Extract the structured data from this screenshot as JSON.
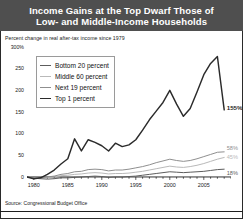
{
  "title": {
    "line1": "Income Gains at the Top Dwarf Those of",
    "line2": "Low- and Middle-Income Households"
  },
  "subtitle": "Percent change in real after-tax income since 1979",
  "source": "Source: Congressional Budget Office",
  "colors": {
    "title_bar": "#4f4f4f",
    "title_text": "#ffffff",
    "top1": "#2b2b2b",
    "next19": "#8f8f8f",
    "middle60": "#b9b9b9",
    "bottom20": "#5d5d5d",
    "axis": "#1a1a1a",
    "frame": "#2a2a2a"
  },
  "chart_data": {
    "type": "line",
    "title": "Income Gains at the Top Dwarf Those of Low- and Middle-Income Households",
    "subtitle": "Percent change in real after-tax income since 1979",
    "xlabel": "",
    "ylabel": "Percent change in real after-tax income since 1979",
    "xlim": [
      1979,
      2009
    ],
    "ylim": [
      0,
      300
    ],
    "grid": false,
    "legend_position": "upper-left-inside",
    "ytick_labels": [
      "300%",
      "250",
      "200",
      "150",
      "100",
      "50",
      "0"
    ],
    "ytick_values": [
      300,
      250,
      200,
      150,
      100,
      50,
      0
    ],
    "xtick_labels": [
      "1980",
      "1985",
      "1990",
      "1995",
      "2000",
      "2005"
    ],
    "xtick_values": [
      1980,
      1985,
      1990,
      1995,
      2000,
      2005
    ],
    "x": [
      1979,
      1980,
      1981,
      1982,
      1983,
      1984,
      1985,
      1986,
      1987,
      1988,
      1989,
      1990,
      1991,
      1992,
      1993,
      1994,
      1995,
      1996,
      1997,
      1998,
      1999,
      2000,
      2001,
      2002,
      2003,
      2004,
      2005,
      2006,
      2007,
      2008
    ],
    "series": [
      {
        "name": "Top 1 percent",
        "color": "#2b2b2b",
        "end_label": "155%",
        "end_value": 155,
        "values": [
          0,
          -4,
          -2,
          6,
          16,
          30,
          42,
          88,
          60,
          86,
          80,
          72,
          60,
          78,
          70,
          74,
          86,
          108,
          132,
          152,
          172,
          200,
          168,
          140,
          158,
          196,
          236,
          262,
          278,
          155
        ]
      },
      {
        "name": "Next 19 percent",
        "color": "#8f8f8f",
        "end_label": "58%",
        "end_value": 58,
        "values": [
          0,
          -2,
          -2,
          0,
          2,
          6,
          8,
          12,
          13,
          17,
          18,
          17,
          14,
          16,
          16,
          18,
          21,
          24,
          28,
          33,
          37,
          41,
          38,
          36,
          38,
          42,
          47,
          52,
          57,
          58
        ]
      },
      {
        "name": "Middle 60 percent",
        "color": "#b9b9b9",
        "end_label": "45%",
        "end_value": 45,
        "values": [
          0,
          -2,
          -2,
          -1,
          0,
          3,
          4,
          6,
          7,
          9,
          10,
          9,
          7,
          8,
          8,
          9,
          11,
          13,
          16,
          19,
          22,
          25,
          23,
          22,
          24,
          27,
          31,
          36,
          41,
          45
        ]
      },
      {
        "name": "Bottom 20 percent",
        "color": "#5d5d5d",
        "end_label": "18%",
        "end_value": 18,
        "values": [
          0,
          -3,
          -4,
          -5,
          -4,
          -2,
          -2,
          -1,
          0,
          1,
          2,
          1,
          -1,
          0,
          0,
          1,
          2,
          4,
          6,
          8,
          10,
          12,
          11,
          10,
          11,
          12,
          13,
          15,
          17,
          18
        ]
      }
    ]
  }
}
